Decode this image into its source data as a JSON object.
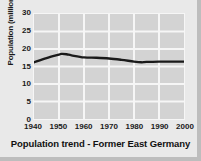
{
  "chart_data": {
    "type": "line",
    "title": "Population trend - Former East Germany",
    "xlabel": "",
    "ylabel": "Population (millions)",
    "xlim": [
      1940,
      2000
    ],
    "ylim": [
      0,
      30
    ],
    "grid": true,
    "legend": "none",
    "line_color": "#1a1a1a",
    "plot_background": "#d3d3d3",
    "gridline_color": "#f6f6f6",
    "xticks": [
      "1940",
      "1950",
      "1960",
      "1970",
      "1980",
      "1990",
      "2000"
    ],
    "yticks": [
      "0",
      "5",
      "10",
      "15",
      "20",
      "25",
      "30"
    ],
    "series": [
      {
        "name": "Population",
        "x": [
          1940,
          1945,
          1950,
          1951,
          1953,
          1955,
          1960,
          1965,
          1970,
          1975,
          1980,
          1983,
          1985,
          1990,
          1995,
          2000
        ],
        "values": [
          16.2,
          17.4,
          18.4,
          18.6,
          18.5,
          18.2,
          17.6,
          17.5,
          17.3,
          16.9,
          16.4,
          16.2,
          16.3,
          16.4,
          16.4,
          16.4
        ]
      }
    ]
  }
}
